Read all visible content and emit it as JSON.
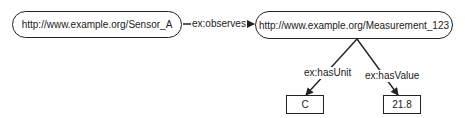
{
  "diagram": {
    "type": "rdf-graph",
    "nodes": [
      {
        "id": "sensor",
        "label": "http://www.example.org/Sensor_A",
        "shape": "rounded"
      },
      {
        "id": "measurement",
        "label": "http://www.example.org/Measurement_123",
        "shape": "rounded"
      },
      {
        "id": "unit",
        "label": "C",
        "shape": "rect"
      },
      {
        "id": "value",
        "label": "21.8",
        "shape": "rect"
      }
    ],
    "edges": [
      {
        "from": "sensor",
        "to": "measurement",
        "label": "ex:observes"
      },
      {
        "from": "measurement",
        "to": "unit",
        "label": "ex:hasUnit"
      },
      {
        "from": "measurement",
        "to": "value",
        "label": "ex:hasValue"
      }
    ],
    "colors": {
      "stroke": "#222222",
      "background": "#ffffff"
    }
  }
}
